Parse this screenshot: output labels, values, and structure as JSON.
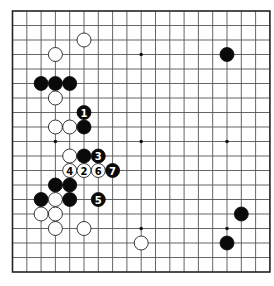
{
  "diagram": {
    "type": "go-board",
    "size": 19,
    "colors": {
      "background": "#ffffff",
      "line": "#555555",
      "border": "#222222",
      "black_stone": "#0a0a0a",
      "white_stone": "#ffffff"
    },
    "star_points": [
      [
        3,
        3
      ],
      [
        9,
        3
      ],
      [
        15,
        3
      ],
      [
        3,
        9
      ],
      [
        9,
        9
      ],
      [
        15,
        9
      ],
      [
        3,
        15
      ],
      [
        9,
        15
      ],
      [
        15,
        15
      ]
    ],
    "stones": [
      {
        "color": "white",
        "col": 5,
        "row": 2,
        "label": ""
      },
      {
        "color": "white",
        "col": 3,
        "row": 3,
        "label": ""
      },
      {
        "color": "black",
        "col": 15,
        "row": 3,
        "label": ""
      },
      {
        "color": "black",
        "col": 2,
        "row": 5,
        "label": ""
      },
      {
        "color": "black",
        "col": 3,
        "row": 5,
        "label": ""
      },
      {
        "color": "black",
        "col": 4,
        "row": 5,
        "label": ""
      },
      {
        "color": "white",
        "col": 3,
        "row": 6,
        "label": ""
      },
      {
        "color": "black",
        "col": 5,
        "row": 7,
        "label": "1"
      },
      {
        "color": "white",
        "col": 3,
        "row": 8,
        "label": ""
      },
      {
        "color": "white",
        "col": 4,
        "row": 8,
        "label": ""
      },
      {
        "color": "black",
        "col": 5,
        "row": 8,
        "label": ""
      },
      {
        "color": "white",
        "col": 4,
        "row": 10,
        "label": ""
      },
      {
        "color": "black",
        "col": 5,
        "row": 10,
        "label": ""
      },
      {
        "color": "black",
        "col": 6,
        "row": 10,
        "label": "3"
      },
      {
        "color": "white",
        "col": 4,
        "row": 11,
        "label": "4"
      },
      {
        "color": "white",
        "col": 5,
        "row": 11,
        "label": "2"
      },
      {
        "color": "white",
        "col": 6,
        "row": 11,
        "label": "6"
      },
      {
        "color": "black",
        "col": 7,
        "row": 11,
        "label": "7"
      },
      {
        "color": "black",
        "col": 3,
        "row": 12,
        "label": ""
      },
      {
        "color": "black",
        "col": 4,
        "row": 12,
        "label": ""
      },
      {
        "color": "black",
        "col": 2,
        "row": 13,
        "label": ""
      },
      {
        "color": "white",
        "col": 3,
        "row": 13,
        "label": ""
      },
      {
        "color": "black",
        "col": 4,
        "row": 13,
        "label": ""
      },
      {
        "color": "black",
        "col": 6,
        "row": 13,
        "label": "5"
      },
      {
        "color": "white",
        "col": 2,
        "row": 14,
        "label": ""
      },
      {
        "color": "white",
        "col": 3,
        "row": 14,
        "label": ""
      },
      {
        "color": "black",
        "col": 16,
        "row": 14,
        "label": ""
      },
      {
        "color": "white",
        "col": 3,
        "row": 15,
        "label": ""
      },
      {
        "color": "white",
        "col": 5,
        "row": 15,
        "label": ""
      },
      {
        "color": "white",
        "col": 9,
        "row": 16,
        "label": ""
      },
      {
        "color": "black",
        "col": 15,
        "row": 16,
        "label": ""
      }
    ]
  }
}
